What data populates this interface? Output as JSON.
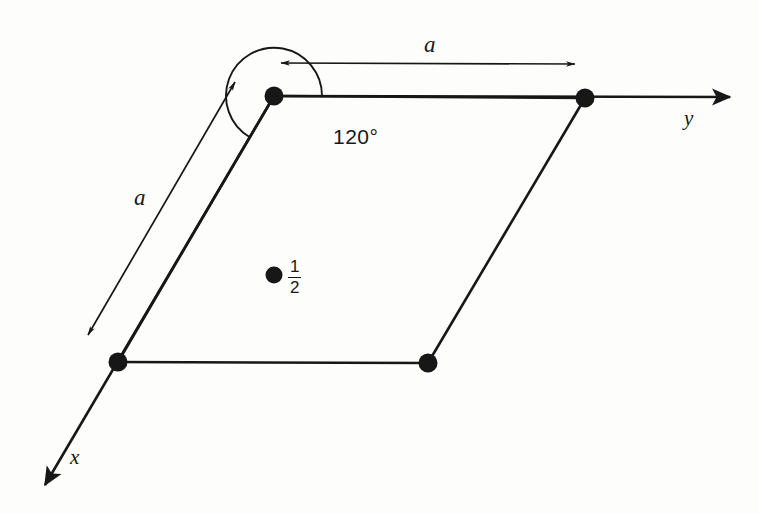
{
  "figure": {
    "kind": "crystal-unit-cell-projection",
    "background_color": "#fdfdfc",
    "ink_color": "#171717"
  },
  "labels": {
    "angle": "120°",
    "dimension_top": "a",
    "dimension_left": "a",
    "axis_y": "y",
    "axis_x": "x",
    "site_fraction_numerator": "1",
    "site_fraction_denominator": "2"
  },
  "geometry": {
    "cell_vertices": [
      {
        "name": "origin-top-left",
        "x": 274,
        "y": 96
      },
      {
        "name": "top-right",
        "x": 585,
        "y": 98
      },
      {
        "name": "bottom-right",
        "x": 428,
        "y": 363
      },
      {
        "name": "bottom-left",
        "x": 118,
        "y": 362
      }
    ],
    "interior_site": {
      "x": 274,
      "y": 275,
      "height": "1/2"
    },
    "axis_y": {
      "from_x": 274,
      "from_y": 96,
      "to_x": 730,
      "to_y": 97
    },
    "axis_x": {
      "from_x": 274,
      "from_y": 96,
      "to_x": 43,
      "to_y": 487
    },
    "dimension_top": {
      "from_x": 278,
      "from_y": 63,
      "to_x": 578,
      "to_y": 64
    },
    "dimension_left": {
      "from_x": 237,
      "from_y": 78,
      "to_x": 85,
      "to_y": 340
    },
    "angle_arc": {
      "center_x": 274,
      "center_y": 96,
      "radius": 48,
      "value_degrees": 120
    }
  }
}
